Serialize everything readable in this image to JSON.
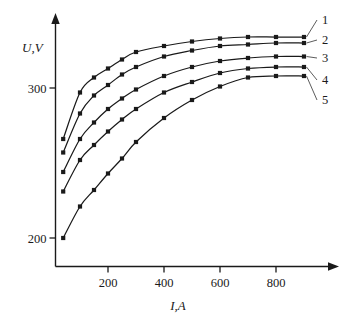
{
  "chart_data": {
    "type": "line",
    "title": "",
    "xlabel": "I,A",
    "ylabel": "U,V",
    "xlim": [
      0,
      960
    ],
    "ylim": [
      160,
      350
    ],
    "grid": false,
    "legend_position": "right-labels",
    "xticks": [
      200,
      400,
      600,
      800
    ],
    "xtick_labels": [
      "200",
      "400",
      "600",
      "800"
    ],
    "yticks": [
      200,
      300
    ],
    "ytick_labels": [
      "200",
      "300"
    ],
    "marker": "filled-square",
    "series": [
      {
        "name": "1",
        "label": "1",
        "x": [
          40,
          100,
          150,
          200,
          250,
          300,
          400,
          500,
          600,
          700,
          800,
          900
        ],
        "y": [
          266,
          297,
          307,
          313,
          319,
          324,
          328,
          331,
          333,
          334,
          334,
          334
        ]
      },
      {
        "name": "2",
        "label": "2",
        "x": [
          40,
          100,
          150,
          200,
          250,
          300,
          400,
          500,
          600,
          700,
          800,
          900
        ],
        "y": [
          257,
          283,
          295,
          302,
          309,
          314,
          321,
          325,
          328,
          329,
          330,
          330
        ]
      },
      {
        "name": "3",
        "label": "3",
        "x": [
          40,
          100,
          150,
          200,
          250,
          300,
          400,
          500,
          600,
          700,
          800,
          900
        ],
        "y": [
          244,
          266,
          277,
          286,
          293,
          299,
          308,
          314,
          318,
          320,
          321,
          321
        ]
      },
      {
        "name": "4",
        "label": "4",
        "x": [
          40,
          100,
          150,
          200,
          250,
          300,
          400,
          500,
          600,
          700,
          800,
          900
        ],
        "y": [
          231,
          252,
          262,
          271,
          279,
          286,
          297,
          304,
          310,
          313,
          314,
          314
        ]
      },
      {
        "name": "5",
        "label": "5",
        "x": [
          40,
          100,
          150,
          200,
          250,
          300,
          400,
          500,
          600,
          700,
          800,
          900
        ],
        "y": [
          200,
          221,
          232,
          243,
          253,
          264,
          280,
          292,
          301,
          307,
          308,
          308
        ]
      }
    ]
  },
  "axis": {
    "y_label": "U,V",
    "x_label": "I,A"
  },
  "curve_labels": [
    "1",
    "2",
    "3",
    "4",
    "5"
  ]
}
